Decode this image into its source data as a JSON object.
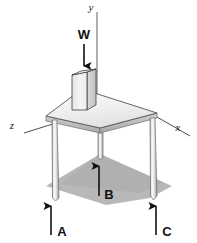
{
  "figure": {
    "background_color": "#ffffff"
  },
  "axes": [
    {
      "id": "y",
      "label": "y",
      "orientation": "vertical-up",
      "label_x": 95,
      "label_y": 13
    },
    {
      "id": "x",
      "label": "x",
      "orientation": "right-down",
      "label_x": 179,
      "label_y": 139
    },
    {
      "id": "z",
      "label": "z",
      "orientation": "left-down",
      "label_x": 14,
      "label_y": 126
    }
  ],
  "forces": [
    {
      "id": "W",
      "label": "W",
      "direction": "down",
      "label_x": 84,
      "label_y": 38,
      "color": "#111111"
    },
    {
      "id": "A",
      "label": "A",
      "direction": "up",
      "label_x": 63,
      "label_y": 234,
      "color": "#111111"
    },
    {
      "id": "B",
      "label": "B",
      "direction": "up",
      "label_x": 105,
      "label_y": 203,
      "color": "#111111"
    },
    {
      "id": "C",
      "label": "C",
      "direction": "up",
      "label_x": 168,
      "label_y": 234,
      "color": "#111111"
    }
  ],
  "objects": {
    "tabletop": {
      "name": "triangular-tabletop",
      "surface_color": "#f2f2f2",
      "edge_color": "#b9b9b9",
      "outline_color": "#4a4a4a"
    },
    "block": {
      "name": "rectangular-block",
      "top_color": "#f7f7f7",
      "left_color": "#ededed",
      "right_color": "#d2d2d2",
      "outline_color": "#3c3c3c"
    },
    "legs": {
      "name": "table-legs",
      "count": 3,
      "body_color": "#d9d9d9",
      "highlight_color": "#fafafa",
      "outline_color": "#6a6a6a"
    },
    "shadow": {
      "name": "ground-shadow",
      "color": "#b0b0b0"
    }
  }
}
